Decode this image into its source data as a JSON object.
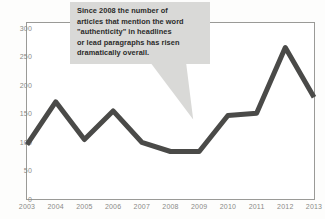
{
  "chart_data": {
    "type": "line",
    "title": "",
    "xlabel": "",
    "ylabel": "",
    "categories": [
      "2003",
      "2004",
      "2005",
      "2006",
      "2007",
      "2008",
      "2009",
      "2010",
      "2011",
      "2012",
      "2013"
    ],
    "values": [
      97,
      172,
      106,
      156,
      101,
      85,
      85,
      148,
      152,
      267,
      180
    ],
    "series": [
      {
        "name": "Articles mentioning \"authenticity\"",
        "values": [
          97,
          172,
          106,
          156,
          101,
          85,
          85,
          148,
          152,
          267,
          180
        ]
      }
    ],
    "ylim": [
      0,
      310
    ],
    "yticks": [
      0,
      50,
      100,
      150,
      200,
      250,
      300
    ],
    "ytick_labels": [
      "0",
      "50",
      "100",
      "150",
      "200",
      "250",
      "300"
    ],
    "xtick_labels": [
      "2003",
      "2004",
      "2005",
      "2006",
      "2007",
      "2008",
      "2009",
      "2010",
      "2011",
      "2012",
      "2013"
    ],
    "grid": false,
    "legend": "none",
    "line_color": "#4a4a48",
    "line_width": 5,
    "annotations": [
      {
        "text": "Since 2008 the number of\narticles that mention the word\n\"authenticity\" in headlines\nor lead paragraphs has risen\ndramatically overall.",
        "points_to_category": "2009",
        "style": "callout-box-with-tail",
        "background": "#d9d9d7"
      }
    ]
  },
  "colors": {
    "line": "#4a4a48",
    "callout_bg": "#d9d9d7",
    "callout_text": "#2b2b2a",
    "axis": "#9a9a97",
    "tick_label": "#8a8a87",
    "page_bg": "#fdfdfc"
  },
  "annotation": {
    "text": "Since 2008 the number of\narticles that mention the word\n\"authenticity\" in headlines\nor lead paragraphs has risen\ndramatically overall."
  }
}
